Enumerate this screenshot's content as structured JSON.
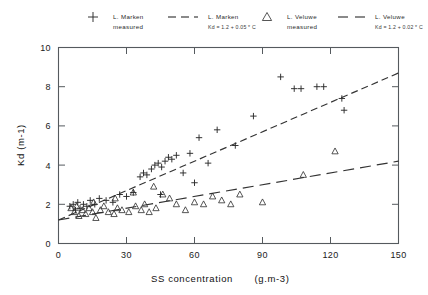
{
  "chart_data": {
    "type": "scatter",
    "title": "",
    "xlabel": "SS concentration",
    "xunit": "(g.m-3)",
    "ylabel": "Kd (m-1)",
    "xlim": [
      0,
      150
    ],
    "ylim": [
      0,
      10
    ],
    "xticks": [
      0,
      30,
      60,
      90,
      120,
      150
    ],
    "yticks": [
      0,
      2,
      4,
      6,
      8,
      10
    ],
    "grid": false,
    "legend_position": "above-plot",
    "series": [
      {
        "name": "L. Marken measured",
        "marker": "plus",
        "points": [
          [
            5.0,
            1.9
          ],
          [
            6.5,
            2.0
          ],
          [
            7.5,
            1.7
          ],
          [
            8.5,
            2.1
          ],
          [
            9.5,
            1.8
          ],
          [
            11.0,
            2.0
          ],
          [
            12.5,
            1.9
          ],
          [
            14.0,
            2.2
          ],
          [
            16.0,
            2.0
          ],
          [
            18.0,
            2.3
          ],
          [
            21.0,
            2.2
          ],
          [
            24.0,
            2.1
          ],
          [
            27.0,
            2.5
          ],
          [
            30.0,
            2.4
          ],
          [
            33.0,
            2.6
          ],
          [
            36.0,
            3.4
          ],
          [
            37.5,
            3.6
          ],
          [
            39.0,
            3.5
          ],
          [
            41.0,
            3.8
          ],
          [
            42.5,
            4.0
          ],
          [
            44.0,
            4.1
          ],
          [
            45.5,
            3.9
          ],
          [
            47.0,
            4.2
          ],
          [
            48.5,
            4.4
          ],
          [
            50.0,
            4.3
          ],
          [
            52.0,
            4.5
          ],
          [
            55.0,
            3.6
          ],
          [
            58.0,
            4.6
          ],
          [
            62.0,
            5.4
          ],
          [
            66.0,
            4.1
          ],
          [
            70.0,
            5.8
          ],
          [
            78.0,
            5.0
          ],
          [
            86.0,
            6.5
          ],
          [
            98.0,
            8.5
          ],
          [
            104.0,
            7.9
          ],
          [
            107.0,
            7.9
          ],
          [
            114.0,
            8.0
          ],
          [
            117.0,
            8.0
          ],
          [
            125.0,
            7.4
          ],
          [
            126.0,
            6.8
          ],
          [
            60.0,
            3.1
          ],
          [
            45.0,
            2.5
          ]
        ]
      },
      {
        "name": "L. Veluwe measured",
        "marker": "triangle",
        "points": [
          [
            5.5,
            1.8
          ],
          [
            7.0,
            1.6
          ],
          [
            8.0,
            1.9
          ],
          [
            9.0,
            1.4
          ],
          [
            10.5,
            1.7
          ],
          [
            12.0,
            1.5
          ],
          [
            13.5,
            1.8
          ],
          [
            15.0,
            1.6
          ],
          [
            16.5,
            1.3
          ],
          [
            18.5,
            1.7
          ],
          [
            20.0,
            1.9
          ],
          [
            22.0,
            1.6
          ],
          [
            24.5,
            1.5
          ],
          [
            26.0,
            1.8
          ],
          [
            28.0,
            1.7
          ],
          [
            31.0,
            1.6
          ],
          [
            34.0,
            1.9
          ],
          [
            36.5,
            1.7
          ],
          [
            38.0,
            2.0
          ],
          [
            40.0,
            1.6
          ],
          [
            43.0,
            1.8
          ],
          [
            46.0,
            2.5
          ],
          [
            49.0,
            2.3
          ],
          [
            52.0,
            2.0
          ],
          [
            56.0,
            1.7
          ],
          [
            60.0,
            2.1
          ],
          [
            64.0,
            2.0
          ],
          [
            68.0,
            2.4
          ],
          [
            72.0,
            2.2
          ],
          [
            76.0,
            2.0
          ],
          [
            80.0,
            2.5
          ],
          [
            90.0,
            2.1
          ],
          [
            108.0,
            3.5
          ],
          [
            122.0,
            4.7
          ],
          [
            42.0,
            2.9
          ],
          [
            33.0,
            2.6
          ],
          [
            25.0,
            2.3
          ],
          [
            15.5,
            2.1
          ]
        ]
      }
    ],
    "fits": [
      {
        "name": "L. Marken fit",
        "equation": "Kd = 1.2 + 0.05 * C",
        "intercept": 1.2,
        "slope": 0.05,
        "style": "dashed-short"
      },
      {
        "name": "L. Veluwe fit",
        "equation": "Kd = 1.2 + 0.02 * C",
        "intercept": 1.2,
        "slope": 0.02,
        "style": "dashed-long"
      }
    ]
  },
  "legend": {
    "items": [
      {
        "symbol": "plus",
        "line1": "L. Marken",
        "line2": "measured"
      },
      {
        "symbol": "dash-short",
        "line1": "L. Marken",
        "line2": "Kd = 1.2 + 0.05 * C"
      },
      {
        "symbol": "triangle",
        "line1": "L. Veluwe",
        "line2": "measured"
      },
      {
        "symbol": "dash-long",
        "line1": "L. Veluwe",
        "line2": "Kd = 1.2 + 0.02 * C"
      }
    ]
  },
  "axes": {
    "y_title": "Kd (m-1)",
    "x_title": "SS concentration",
    "x_unit": "(g.m-3)",
    "x_tick_labels": [
      "0",
      "30",
      "60",
      "90",
      "120",
      "150"
    ],
    "y_tick_labels": [
      "0",
      "2",
      "4",
      "6",
      "8",
      "10"
    ]
  },
  "colors": {
    "background": "#ffffff",
    "axis": "#555a5e",
    "marker": "#2b2b2b",
    "fitline": "#333333",
    "text": "#1a1a1a"
  }
}
